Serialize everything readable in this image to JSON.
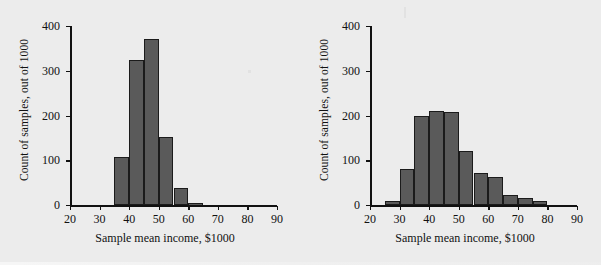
{
  "figure": {
    "background_color": "#ececec",
    "bar_color": "#5a5a5a",
    "bar_edge_color": "#1b1b1b",
    "axis_color": "#111111"
  },
  "panels": [
    {
      "name": "left-histogram",
      "ylabel": "Count of samples, out of 1000",
      "xlabel": "Sample mean income, $1000",
      "yticks": [
        "0",
        "100",
        "200",
        "300",
        "400"
      ],
      "xticks": [
        "20",
        "30",
        "40",
        "50",
        "60",
        "70",
        "80",
        "90"
      ]
    },
    {
      "name": "right-histogram",
      "ylabel": "Count of samples, out of 1000",
      "xlabel": "Sample mean income, $1000",
      "yticks": [
        "0",
        "100",
        "200",
        "300",
        "400"
      ],
      "xticks": [
        "20",
        "30",
        "40",
        "50",
        "60",
        "70",
        "80",
        "90"
      ]
    }
  ],
  "chart_data": [
    {
      "type": "bar",
      "subtype": "histogram",
      "title": "",
      "panel": "left",
      "xlabel": "Sample mean income, $1000",
      "ylabel": "Count of samples, out of 1000",
      "xlim": [
        20,
        90
      ],
      "ylim": [
        0,
        400
      ],
      "ytick_values": [
        0,
        100,
        200,
        300,
        400
      ],
      "xtick_values": [
        20,
        30,
        40,
        50,
        60,
        70,
        80,
        90
      ],
      "bin_width": 5,
      "bin_edges": [
        35,
        40,
        45,
        50,
        55,
        60,
        65
      ],
      "categories": [
        "35-40",
        "40-45",
        "45-50",
        "50-55",
        "55-60",
        "60-65"
      ],
      "values": [
        108,
        325,
        370,
        152,
        38,
        5
      ],
      "grid": false,
      "legend": null
    },
    {
      "type": "bar",
      "subtype": "histogram",
      "title": "",
      "panel": "right",
      "xlabel": "Sample mean income, $1000",
      "ylabel": "Count of samples, out of 1000",
      "xlim": [
        20,
        90
      ],
      "ylim": [
        0,
        400
      ],
      "ytick_values": [
        0,
        100,
        200,
        300,
        400
      ],
      "xtick_values": [
        20,
        30,
        40,
        50,
        60,
        70,
        80,
        90
      ],
      "bin_width": 5,
      "bin_edges": [
        25,
        30,
        35,
        40,
        45,
        50,
        55,
        60,
        65,
        70,
        75,
        80
      ],
      "categories": [
        "25-30",
        "30-35",
        "35-40",
        "40-45",
        "45-50",
        "50-55",
        "55-60",
        "60-65",
        "65-70",
        "70-75",
        "75-80"
      ],
      "values": [
        10,
        80,
        198,
        209,
        207,
        121,
        72,
        62,
        22,
        15,
        8
      ],
      "grid": false,
      "legend": null
    }
  ]
}
